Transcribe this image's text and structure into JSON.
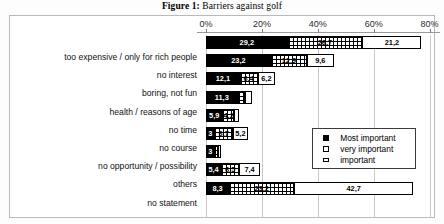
{
  "figure": {
    "caption_label": "Figure 1:",
    "caption_text": " Barriers against golf"
  },
  "chart_data": {
    "type": "bar",
    "orientation": "horizontal",
    "stacked": true,
    "title": "Figure 1: Barriers against golf",
    "xlabel": "",
    "ylabel": "",
    "xlim": [
      0,
      80
    ],
    "tick_labels": [
      "0%",
      "20%",
      "40%",
      "60%",
      "80%"
    ],
    "tick_values": [
      0,
      20,
      40,
      60,
      80
    ],
    "grid": true,
    "legend_position": "middle-right",
    "categories": [
      "too expensive / only for rich people",
      "no interest",
      "boring, not fun",
      "health / reasons of age",
      "no time",
      "no course",
      "no opportunity / possibility",
      "others",
      "no statement"
    ],
    "series": [
      {
        "name": "Most important",
        "color": "#000000",
        "values": [
          29.2,
          23.2,
          12.1,
          11.3,
          5.9,
          3.0,
          3.0,
          5.4,
          8.3
        ],
        "labels": [
          "29,2",
          "23,2",
          "12,1",
          "11,3",
          "5,9",
          "3",
          "3",
          "5,4",
          "8,3"
        ]
      },
      {
        "name": "very important",
        "color": "#ffffff",
        "values": [
          26.7,
          12.9,
          6.4,
          2.6,
          4.2,
          6.7,
          1.4,
          6.5,
          23.2
        ],
        "labels": [
          "26,7",
          "12,9",
          "6,4",
          "",
          "4,2",
          "6,7",
          "",
          "6,5",
          "23,2"
        ]
      },
      {
        "name": "important",
        "color": "#ffffff",
        "values": [
          21.2,
          9.6,
          6.2,
          2.4,
          1.8,
          5.2,
          1.0,
          7.4,
          42.7
        ],
        "labels": [
          "21,2",
          "9,6",
          "6,2",
          "",
          "",
          "5,2",
          "",
          "7,4",
          "42,7"
        ]
      }
    ]
  },
  "legend": {
    "items": [
      {
        "label": "Most important",
        "swatch": "filled-black-square"
      },
      {
        "label": "very important",
        "swatch": "dotted-white-square"
      },
      {
        "label": "important",
        "swatch": "white-rectangle"
      }
    ]
  }
}
